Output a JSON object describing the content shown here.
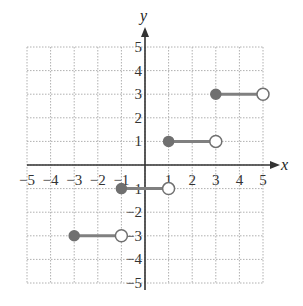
{
  "chart_data": {
    "type": "step",
    "title": "",
    "xlabel": "x",
    "ylabel": "y",
    "xlim": [
      -5,
      5
    ],
    "ylim": [
      -5,
      5
    ],
    "grid": true,
    "x_ticks": [
      -5,
      -4,
      -3,
      -2,
      -1,
      1,
      2,
      3,
      4,
      5
    ],
    "y_ticks": [
      5,
      4,
      3,
      2,
      1,
      -2,
      -3,
      -4,
      -5
    ],
    "x_tick_labels": [
      "−5",
      "−4",
      "−3",
      "−2",
      "−1",
      "1",
      "2",
      "3",
      "4",
      "5"
    ],
    "y_tick_labels": [
      "5",
      "4",
      "3",
      "2",
      "1",
      "−1",
      "−2",
      "−3",
      "−4",
      "−5"
    ],
    "segments": [
      {
        "x_start": -3,
        "x_end": -1,
        "y": -3,
        "start_closed": true,
        "end_closed": false
      },
      {
        "x_start": -1,
        "x_end": 1,
        "y": -1,
        "start_closed": true,
        "end_closed": false
      },
      {
        "x_start": 1,
        "x_end": 3,
        "y": 1,
        "start_closed": true,
        "end_closed": false
      },
      {
        "x_start": 3,
        "x_end": 5,
        "y": 3,
        "start_closed": true,
        "end_closed": false
      }
    ],
    "colors": {
      "segment": "#808080",
      "closed_dot": "#707070",
      "open_dot_stroke": "#707070",
      "axis": "#333333",
      "grid": "#b0b0b0"
    }
  }
}
